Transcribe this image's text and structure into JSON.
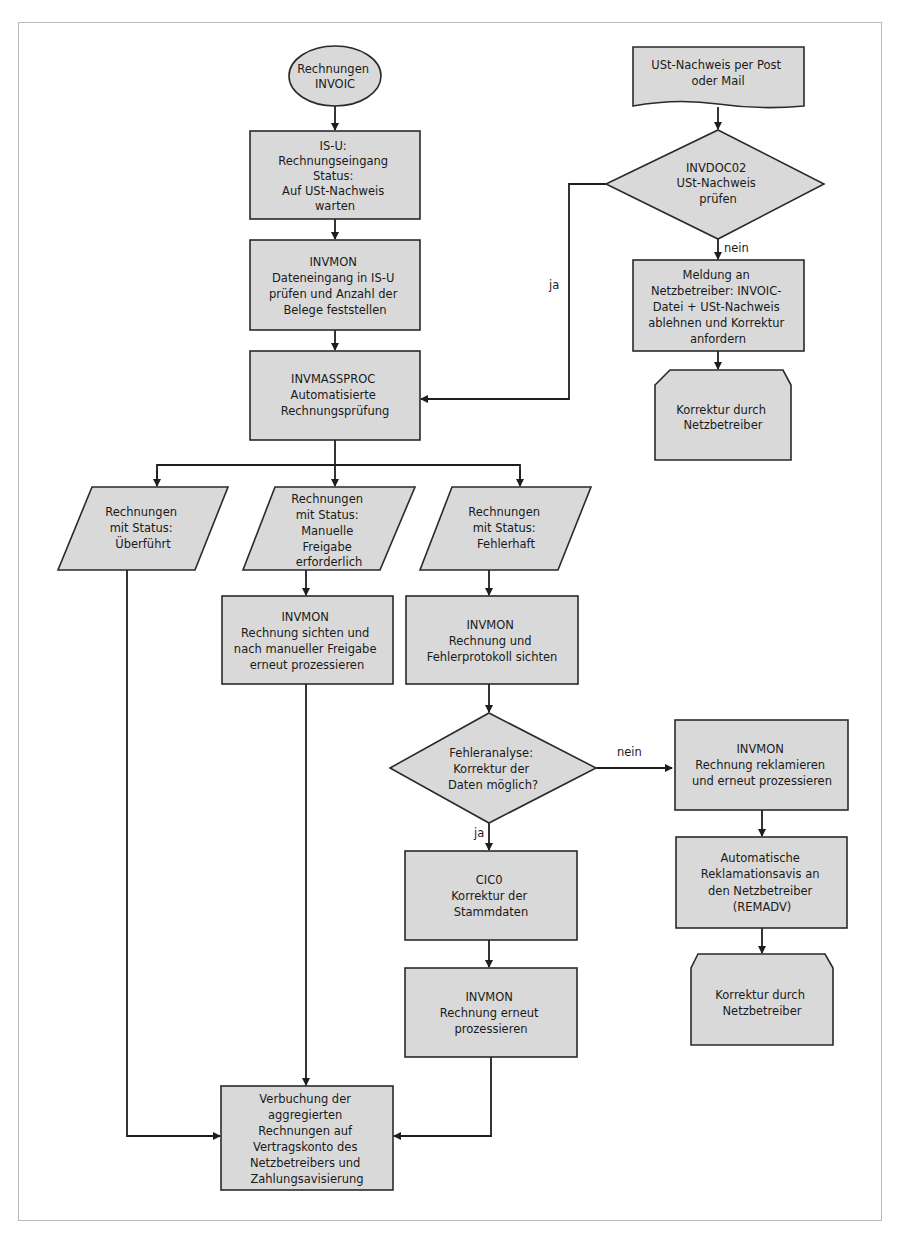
{
  "diagram": {
    "colors": {
      "shape_fill": "#d9d9d9",
      "stroke": "#2a2a2a",
      "frame": "#b9b9b9"
    },
    "nodes": {
      "start": {
        "type": "ellipse",
        "lines": [
          "Rechnungen",
          "INVOIC"
        ]
      },
      "isu_eingang": {
        "type": "process",
        "lines": [
          "IS-U:",
          "Rechnungseingang",
          "Status:",
          "Auf USt-Nachweis",
          "warten"
        ]
      },
      "invmon_check": {
        "type": "process",
        "lines": [
          "INVMON",
          "Dateneingang in IS-U",
          "prüfen und Anzahl der",
          "Belege feststellen"
        ]
      },
      "invmassproc": {
        "type": "process",
        "lines": [
          "INVMASSPROC",
          "Automatisierte",
          "Rechnungsprüfung"
        ]
      },
      "ust_post": {
        "type": "document",
        "lines": [
          "USt-Nachweis per Post",
          "oder Mail"
        ]
      },
      "invdoc02": {
        "type": "decision",
        "lines": [
          "INVDOC02",
          "USt-Nachweis",
          "prüfen"
        ]
      },
      "meldung": {
        "type": "process",
        "lines": [
          "Meldung an",
          "Netzbetreiber: INVOIC-",
          "Datei + USt-Nachweis",
          "ablehnen und Korrektur",
          "anfordern"
        ]
      },
      "korrektur_nb1": {
        "type": "loop-limit",
        "lines": [
          "Korrektur durch",
          "Netzbetreiber"
        ]
      },
      "status_ueberfuehrt": {
        "type": "data",
        "lines": [
          "Rechnungen",
          "mit Status:",
          "Überführt"
        ]
      },
      "status_manuell": {
        "type": "data",
        "lines": [
          "Rechnungen",
          "mit Status:",
          "Manuelle",
          "Freigabe",
          "erforderlich"
        ]
      },
      "status_fehlerhaft": {
        "type": "data",
        "lines": [
          "Rechnungen",
          "mit Status:",
          "Fehlerhaft"
        ]
      },
      "invmon_freigabe": {
        "type": "process",
        "lines": [
          "INVMON",
          "Rechnung sichten und",
          "nach manueller Freigabe",
          "erneut prozessieren"
        ]
      },
      "invmon_fehler": {
        "type": "process",
        "lines": [
          "INVMON",
          "Rechnung und",
          "Fehlerprotokoll sichten"
        ]
      },
      "fehleranalyse": {
        "type": "decision",
        "lines": [
          "Fehleranalyse:",
          "Korrektur der",
          "Daten möglich?"
        ]
      },
      "invmon_reklam": {
        "type": "process",
        "lines": [
          "INVMON",
          "Rechnung reklamieren",
          "und erneut prozessieren"
        ]
      },
      "remadv": {
        "type": "process",
        "lines": [
          "Automatische",
          "Reklamationsavis an",
          "den Netzbetreiber",
          "(REMADV)"
        ]
      },
      "korrektur_nb2": {
        "type": "loop-limit",
        "lines": [
          "Korrektur durch",
          "Netzbetreiber"
        ]
      },
      "cic0": {
        "type": "process",
        "lines": [
          "CIC0",
          "Korrektur der",
          "Stammdaten"
        ]
      },
      "invmon_erneut": {
        "type": "process",
        "lines": [
          "INVMON",
          "Rechnung erneut",
          "prozessieren"
        ]
      },
      "verbuchung": {
        "type": "process",
        "lines": [
          "Verbuchung der",
          "aggregierten",
          "Rechnungen auf",
          "Vertragskonto des",
          "Netzbetreibers und",
          "Zahlungsavisierung"
        ]
      }
    },
    "edge_labels": {
      "invdoc02_ja": "ja",
      "invdoc02_nein": "nein",
      "fehler_nein": "nein",
      "fehler_ja": "ja"
    }
  }
}
